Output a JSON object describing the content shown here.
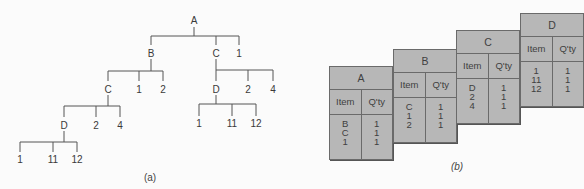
{
  "panel_a": {
    "caption": "(a)",
    "nodes": {
      "root": "A",
      "b": "B",
      "c_right": "C",
      "one_top": "1",
      "c_left": "C",
      "b_one": "1",
      "b_two": "2",
      "d_right": "D",
      "cr_two": "2",
      "cr_four": "4",
      "d_left": "D",
      "cl_two": "2",
      "cl_four": "4",
      "dr_1": "1",
      "dr_11": "11",
      "dr_12": "12",
      "dl_1": "1",
      "dl_11": "11",
      "dl_12": "12"
    }
  },
  "panel_b": {
    "caption": "(b)",
    "col_item": "Item",
    "col_qty": "Q'ty",
    "tables": [
      {
        "parent": "A",
        "items": [
          "B",
          "C",
          "1"
        ],
        "qty": [
          "1",
          "1",
          "1"
        ]
      },
      {
        "parent": "B",
        "items": [
          "C",
          "1",
          "2"
        ],
        "qty": [
          "1",
          "1",
          "1"
        ]
      },
      {
        "parent": "C",
        "items": [
          "D",
          "2",
          "4"
        ],
        "qty": [
          "1",
          "1",
          "1"
        ]
      },
      {
        "parent": "D",
        "items": [
          "1",
          "11",
          "12"
        ],
        "qty": [
          "1",
          "1",
          "1"
        ]
      }
    ]
  }
}
